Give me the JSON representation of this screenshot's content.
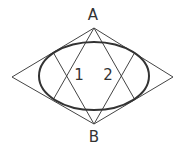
{
  "diagram": {
    "type": "geometric-construction",
    "labels": {
      "top": "A",
      "bottom": "B",
      "region1": "1",
      "region2": "2"
    },
    "colors": {
      "stroke": "#444444",
      "ellipse": "#333333",
      "background": "#ffffff"
    }
  }
}
